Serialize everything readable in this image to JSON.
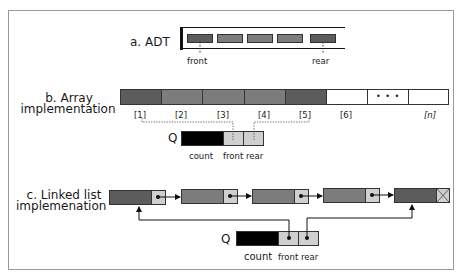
{
  "sections": {
    "adt": {
      "label": "a. ADT",
      "front_label": "front",
      "rear_label": "rear",
      "element_count": 5
    },
    "array": {
      "label_line1": "b. Array",
      "label_line2": "implementation",
      "indices": [
        "[1]",
        "[2]",
        "[3]",
        "[4]",
        "[5]",
        "[6]",
        "",
        "[n]"
      ],
      "ellipsis": "• • •",
      "q_label": "Q",
      "fields": [
        "count",
        "front",
        "rear"
      ]
    },
    "linked": {
      "label_line1": "c. Linked list",
      "label_line2": "implemenation",
      "node_count": 5,
      "q_label": "Q",
      "fields": [
        "count",
        "front",
        "rear"
      ]
    }
  },
  "colors": {
    "dark_cell": "#5c5c5c",
    "mid_cell": "#7c7c7c",
    "pointer_cell": "#cfcfcf",
    "count_cell": "#000000",
    "frame": "#9a9a9a"
  }
}
